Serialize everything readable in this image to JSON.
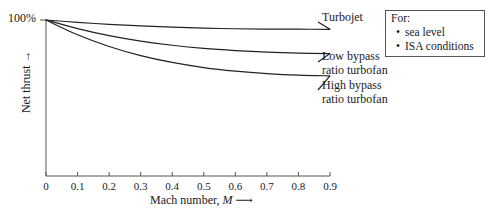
{
  "chart_data": {
    "type": "line",
    "title": "",
    "xlabel": "Mach number, M",
    "ylabel": "Net thrust",
    "xlim": [
      0,
      0.9
    ],
    "ylim": [
      0,
      100
    ],
    "grid": false,
    "y_axis_max_label": "100%",
    "x_tick_labels": [
      "0",
      "0.1",
      "0.2",
      "0.3",
      "0.4",
      "0.5",
      "0.6",
      "0.7",
      "0.8",
      "0.9"
    ],
    "x_tick_values": [
      0,
      0.1,
      0.2,
      0.3,
      0.4,
      0.5,
      0.6,
      0.7,
      0.8,
      0.9
    ],
    "x": [
      0,
      0.1,
      0.2,
      0.3,
      0.4,
      0.5,
      0.6,
      0.7,
      0.8,
      0.9
    ],
    "series": [
      {
        "name": "Turbojet",
        "label_lines": [
          "Turbojet"
        ],
        "values": [
          100,
          98.5,
          97.2,
          96.2,
          95.4,
          94.8,
          94.4,
          94.2,
          94.1,
          94.0
        ],
        "color": "#222222"
      },
      {
        "name": "Low bypass ratio turbofan",
        "label_lines": [
          "Low bypass",
          "ratio turbofan"
        ],
        "values": [
          100,
          94.5,
          90.0,
          86.5,
          83.8,
          81.8,
          80.4,
          79.4,
          78.8,
          78.5
        ],
        "color": "#222222"
      },
      {
        "name": "High bypass ratio turbofan",
        "label_lines": [
          "High bypass",
          "ratio turbofan"
        ],
        "values": [
          100,
          90.5,
          83.0,
          77.2,
          72.8,
          69.5,
          67.2,
          65.6,
          64.6,
          64.2
        ],
        "color": "#222222"
      }
    ],
    "legend": {
      "position": "top-right-box",
      "title": "For:",
      "items": [
        "sea level",
        "ISA conditions"
      ]
    },
    "axis_color": "#555555",
    "text_color": "#1a1a1a"
  }
}
